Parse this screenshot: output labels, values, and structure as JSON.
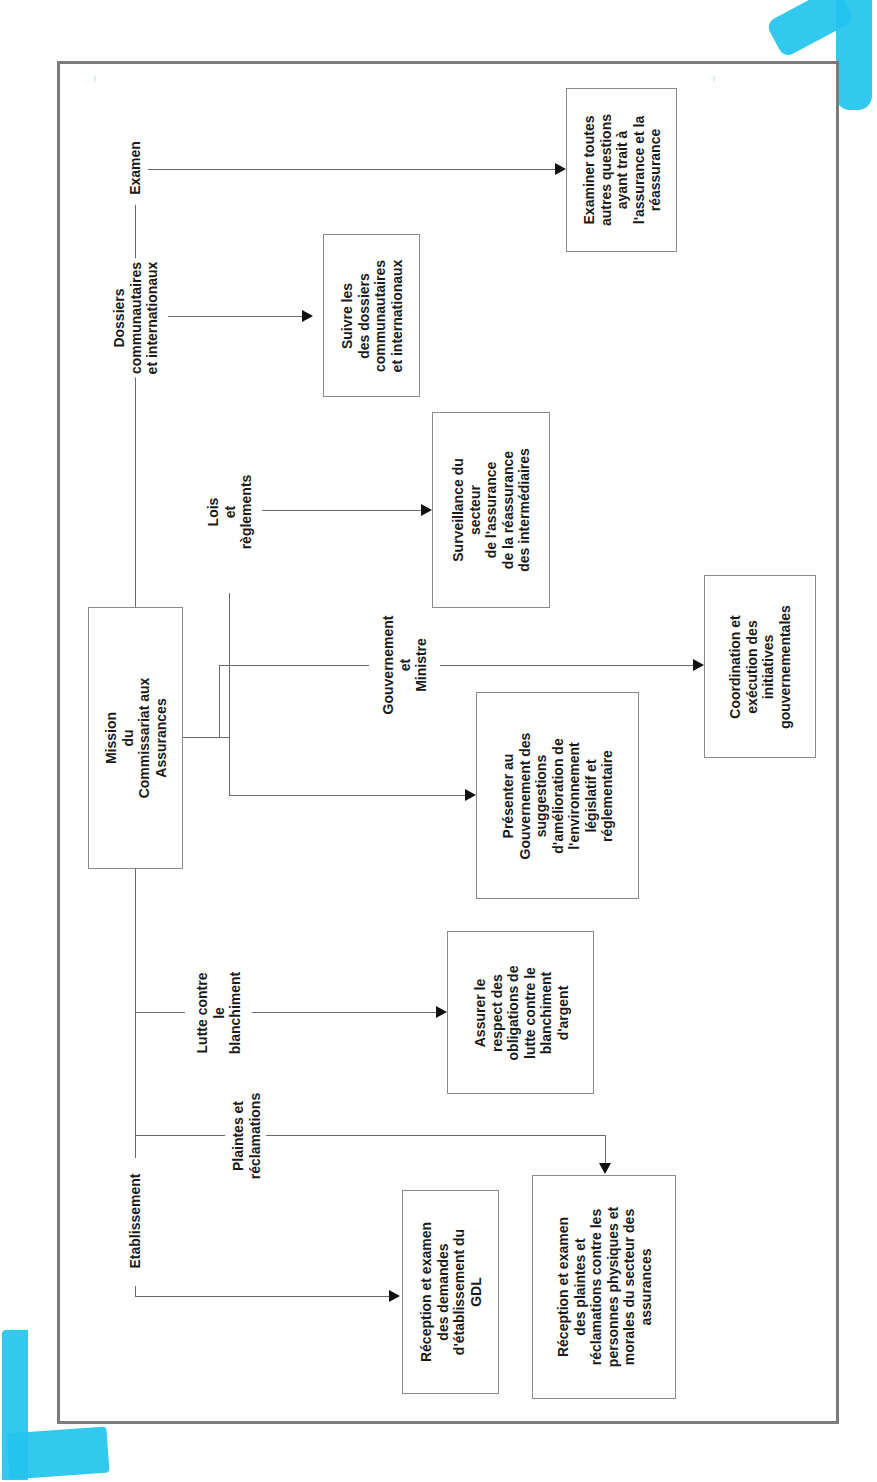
{
  "diagram": {
    "title": "Mission du Commissariat aux Assurances",
    "center": {
      "label": "Mission\ndu\nCommissariat aux\nAssurances"
    },
    "branches": [
      {
        "id": "examen",
        "label": "Examen",
        "target": "Examiner toutes\nautres questions\nayant trait à\nl'assurance et la\nréassurance"
      },
      {
        "id": "dossiers",
        "label": "Dossiers\ncommunautaires\net internationaux",
        "target": "Suivre les\ndes dossiers\ncommunautaires\net internationaux"
      },
      {
        "id": "lois",
        "label": "Lois\net\nrèglements",
        "target": "Surveillance du\nsecteur\nde l'assurance\nde la réassurance\ndes intermédiaires"
      },
      {
        "id": "gouvernement",
        "label": "Gouvernement\net\nMinistre",
        "target": "Coordination et\nexécution des\ninitiatives\ngouvernementales"
      },
      {
        "id": "presenter",
        "label": "",
        "target": "Présenter au\nGouvernement des\nsuggestions\nd'amélioration de\nl'environnement\nlégislatif et\nréglementaire"
      },
      {
        "id": "lutte",
        "label": "Lutte contre\nle\nblanchiment",
        "target": "Assurer le\nrespect des\nobligations de\nlutte contre le\nblanchiment\nd'argent"
      },
      {
        "id": "plaintes",
        "label": "Plaintes et\nréclamations",
        "target": "Réception et examen\ndes plaintes et\nréclamations contre les\npersonnes physiques et\nmorales du secteur des\nassurances"
      },
      {
        "id": "etablissement",
        "label": "Etablissement",
        "target": "Réception et examen\ndes demandes\nd'établissement du\nGDL"
      }
    ],
    "colors": {
      "frame": "#7a7a7a",
      "line": "#6a6a6a",
      "arrow": "#111111",
      "tape": "#22c4ee"
    }
  }
}
